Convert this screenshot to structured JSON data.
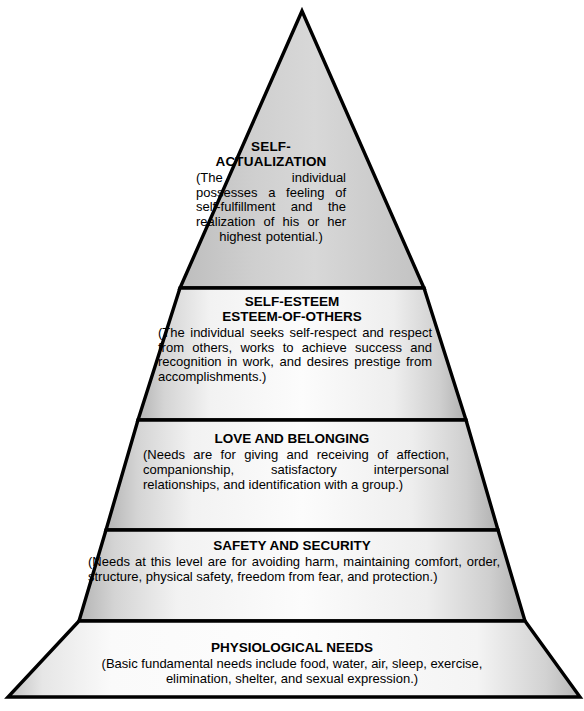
{
  "figure": {
    "name": "maslow-hierarchy-of-needs-pyramid",
    "shape": "five-tier-pyramid",
    "background_color": "#ffffff",
    "outline_color": "#000000",
    "fill_light": "#fbfbfb",
    "fill_mid": "#dcdcdc",
    "fill_dark": "#b9b9b9"
  },
  "tiers": [
    {
      "level": 1,
      "position": "apex",
      "title": "SELF-\nACTUALIZATION",
      "description": "(The individual possesses a feeling of self-fulfillment and the realization of his or her highest potential.)"
    },
    {
      "level": 2,
      "position": "second",
      "title": "SELF-ESTEEM\nESTEEM-OF-OTHERS",
      "description": "(The individual seeks self-respect and respect from others, works to achieve success and recognition in work, and desires prestige from accomplishments.)"
    },
    {
      "level": 3,
      "position": "middle",
      "title": "LOVE AND BELONGING",
      "description": "(Needs are for giving and receiving of affection, companionship, satisfactory interpersonal relationships, and identification with a group.)"
    },
    {
      "level": 4,
      "position": "fourth",
      "title": "SAFETY AND SECURITY",
      "description": "(Needs at this level are for avoiding harm, maintaining comfort, order, structure, physical safety, freedom from fear, and protection.)"
    },
    {
      "level": 5,
      "position": "base",
      "title": "PHYSIOLOGICAL NEEDS",
      "description": "(Basic fundamental needs include food, water, air, sleep, exercise,\nelimination, shelter, and sexual expression.)"
    }
  ]
}
